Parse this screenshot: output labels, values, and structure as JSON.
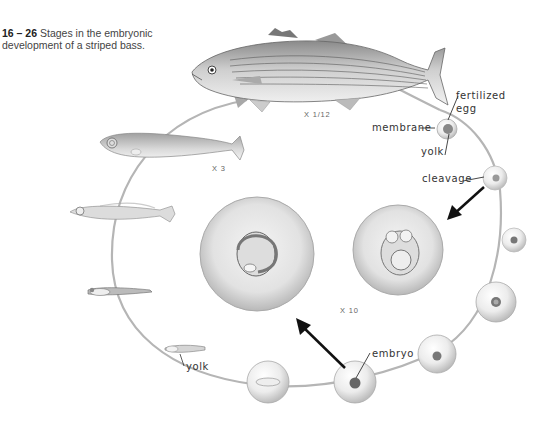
{
  "caption": {
    "figure_number": "16 – 26",
    "text": " Stages in the embryonic development of a striped bass."
  },
  "labels": {
    "fertilized_egg_line1": "fertilized",
    "fertilized_egg_line2": "egg",
    "membrane": "membrane",
    "yolk_egg": "yolk",
    "cleavage": "cleavage",
    "embryo": "embryo",
    "yolk_larva": "yolk"
  },
  "scales": {
    "adult": "X 1/12",
    "larva": "X 3",
    "enlarged_eggs": "X 10"
  },
  "stages": [
    "fertilized egg",
    "cleavage",
    "early embryo",
    "embryo",
    "embryo",
    "embryo",
    "hatching larva",
    "yolk-sac larva",
    "larva",
    "juvenile",
    "adult striped bass"
  ],
  "colors": {
    "cycle_path": "#b5b5b5",
    "arrow_black": "#111111",
    "arrow_gray": "#a8a8a8",
    "egg_fill": "#e6e6e6"
  }
}
